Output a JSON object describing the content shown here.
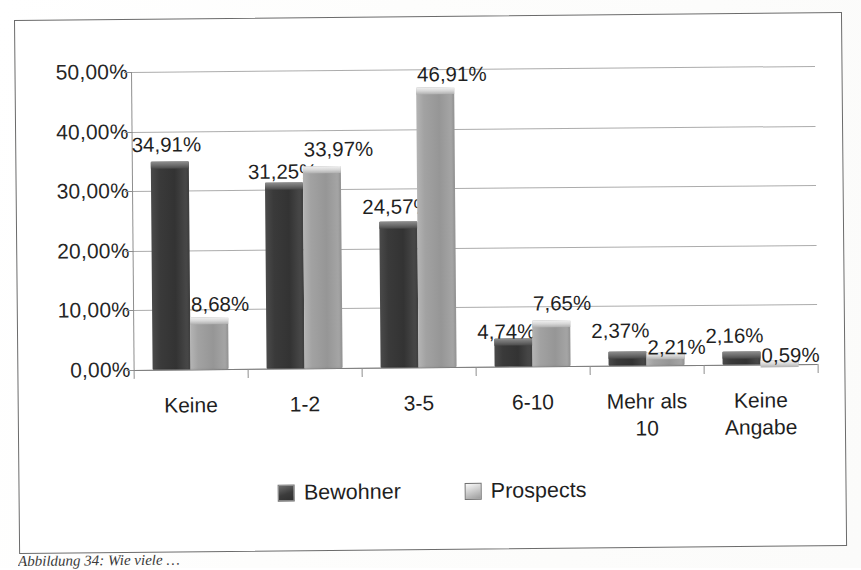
{
  "chart_data": {
    "type": "bar",
    "title": "",
    "subtitle": "",
    "xlabel": "",
    "ylabel": "",
    "categories": [
      "Keine",
      "1-2",
      "3-5",
      "6-10",
      "Mehr als\n10",
      "Keine\nAngabe"
    ],
    "series": [
      {
        "name": "Bewohner",
        "color": "#3a3a3a",
        "values": [
          34.91,
          31.25,
          24.57,
          4.74,
          2.37,
          2.16
        ],
        "labels": [
          "34,91%",
          "31,25%",
          "24,57%",
          "4,74%",
          "2,37%",
          "2,16%"
        ]
      },
      {
        "name": "Prospects",
        "color": "#9a9a9a",
        "values": [
          8.68,
          33.97,
          46.91,
          7.65,
          2.21,
          0.59
        ],
        "labels": [
          "8,68%",
          "33,97%",
          "46,91%",
          "7,65%",
          "2,21%",
          "0,59%"
        ]
      }
    ],
    "ylim": [
      0,
      50
    ],
    "ytick_values": [
      0,
      10,
      20,
      30,
      40,
      50
    ],
    "ytick_labels": [
      "0,00%",
      "10,00%",
      "20,00%",
      "30,00%",
      "40,00%",
      "50,00%"
    ],
    "grid": true,
    "legend_position": "bottom",
    "value_labels_shown": true,
    "decimal_separator": ","
  },
  "legend": {
    "items": [
      {
        "label": "Bewohner",
        "swatch": "dark"
      },
      {
        "label": "Prospects",
        "swatch": "light"
      }
    ]
  },
  "caption": {
    "text": "Abbildung 34: Wie viele …"
  }
}
